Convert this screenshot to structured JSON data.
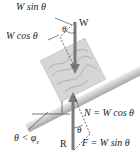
{
  "diagram": {
    "type": "free-body diagram: block on inclined plane",
    "labels": {
      "w_sin": "W sin θ",
      "w_cos": "W cos θ",
      "w": "W",
      "theta_top": "θ",
      "condition": "θ < φ",
      "condition_sub": "s",
      "r": "R",
      "theta_bottom": "θ",
      "normal": "N = W cos θ",
      "friction": "F = W sin θ"
    },
    "colors": {
      "arrow": "#7a7a7a",
      "incline_light": "#e2e2e2",
      "incline_dark": "#a8a8a8",
      "block": "#d4d4d4",
      "grain": "#9a9a9a",
      "text": "#222222"
    }
  }
}
